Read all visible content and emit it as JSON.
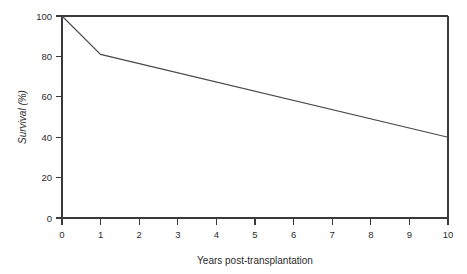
{
  "chart_data": {
    "type": "line",
    "title": "",
    "xlabel": "Years post-transplantation",
    "ylabel": "Survival (%)",
    "xlim": [
      0,
      10
    ],
    "ylim": [
      0,
      100
    ],
    "grid": false,
    "legend": "none",
    "x_ticks": [
      "0",
      "1",
      "2",
      "3",
      "4",
      "5",
      "6",
      "7",
      "8",
      "9",
      "10"
    ],
    "y_ticks": [
      "0",
      "20",
      "40",
      "60",
      "80",
      "100"
    ],
    "x_tick_values": [
      0,
      1,
      2,
      3,
      4,
      5,
      6,
      7,
      8,
      9,
      10
    ],
    "y_tick_values": [
      0,
      20,
      40,
      60,
      80,
      100
    ],
    "series": [
      {
        "name": "Survival",
        "color": "#4a4a4a",
        "x": [
          0,
          1,
          10
        ],
        "values": [
          100,
          81,
          40
        ]
      }
    ]
  },
  "axes": {
    "y_label": "Survival (%)",
    "x_label": "Years post-transplantation"
  },
  "colors": {
    "frame": "#3a3a3a",
    "curve": "#4a4a4a",
    "text": "#2b2b2b",
    "background": "#ffffff"
  }
}
